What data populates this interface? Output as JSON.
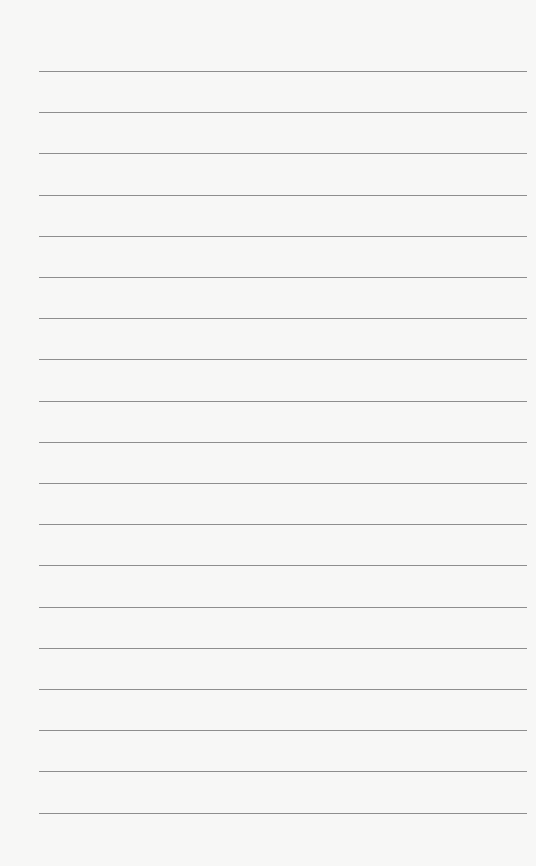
{
  "paper": {
    "background": "#f7f7f6",
    "line_color": "#8e8e8e",
    "line_count": 19,
    "first_line_y": 71,
    "line_spacing": 41.2,
    "line_left": 39,
    "line_width": 488
  }
}
